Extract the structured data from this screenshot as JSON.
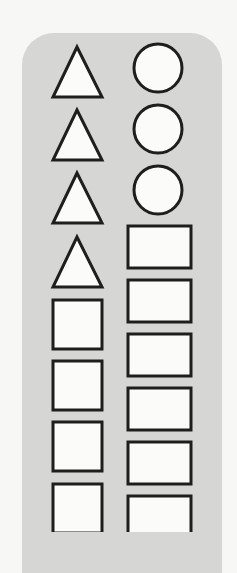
{
  "figure": {
    "colors": {
      "panel": "#d6d6d4",
      "shape_fill": "#fbfbfa",
      "shape_stroke": "#1e1e1e",
      "background": "#f7f7f5"
    },
    "left_column": [
      "triangle",
      "triangle",
      "triangle",
      "triangle",
      "square",
      "square",
      "square",
      "square"
    ],
    "right_column": [
      "circle",
      "circle",
      "circle",
      "rectangle",
      "rectangle",
      "rectangle",
      "rectangle",
      "rectangle",
      "rectangle"
    ],
    "counts": {
      "triangles": 4,
      "circles": 3,
      "squares": 4,
      "rectangles": 6
    }
  }
}
